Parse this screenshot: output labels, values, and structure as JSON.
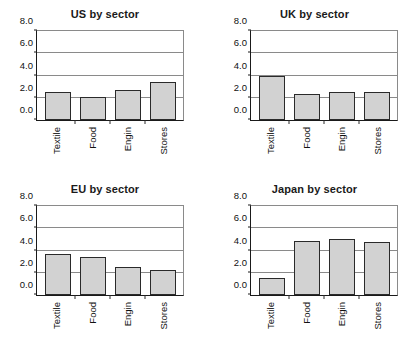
{
  "chart_data": [
    {
      "type": "bar",
      "title": "US by sector",
      "categories": [
        "Textile",
        "Food",
        "Engin",
        "Stores"
      ],
      "values": [
        2.5,
        2.05,
        2.7,
        3.4
      ],
      "xlabel": "",
      "ylabel": "",
      "ylim": [
        0.0,
        8.0
      ],
      "yticks": [
        "0.0",
        "2.0",
        "4.0",
        "6.0",
        "8.0"
      ],
      "ytick_values": [
        0.0,
        2.0,
        4.0,
        6.0,
        8.0
      ],
      "gridlines": [
        2.0,
        4.0,
        6.0
      ],
      "grid": true,
      "legend": "none",
      "bar_color": "#d2d2d2",
      "bar_edge_color": "#2a2a2a"
    },
    {
      "type": "bar",
      "title": "UK by sector",
      "categories": [
        "Textile",
        "Food",
        "Engin",
        "Stores"
      ],
      "values": [
        4.0,
        2.35,
        2.5,
        2.5
      ],
      "xlabel": "",
      "ylabel": "",
      "ylim": [
        0.0,
        8.0
      ],
      "yticks": [
        "0.0",
        "2.0",
        "4.0",
        "6.0",
        "8.0"
      ],
      "ytick_values": [
        0.0,
        2.0,
        4.0,
        6.0,
        8.0
      ],
      "gridlines": [
        2.0,
        4.0,
        6.0
      ],
      "grid": true,
      "legend": "none",
      "bar_color": "#d2d2d2",
      "bar_edge_color": "#2a2a2a"
    },
    {
      "type": "bar",
      "title": "EU by sector",
      "categories": [
        "Textile",
        "Food",
        "Engin",
        "Stores"
      ],
      "values": [
        3.7,
        3.4,
        2.5,
        2.25
      ],
      "xlabel": "",
      "ylabel": "",
      "ylim": [
        0.0,
        8.0
      ],
      "yticks": [
        "0.0",
        "2.0",
        "4.0",
        "6.0",
        "8.0"
      ],
      "ytick_values": [
        0.0,
        2.0,
        4.0,
        6.0,
        8.0
      ],
      "gridlines": [
        2.0,
        4.0,
        6.0
      ],
      "grid": true,
      "legend": "none",
      "bar_color": "#d2d2d2",
      "bar_edge_color": "#2a2a2a"
    },
    {
      "type": "bar",
      "title": "Japan by sector",
      "categories": [
        "Textile",
        "Food",
        "Engin",
        "Stores"
      ],
      "values": [
        1.5,
        4.85,
        5.05,
        4.75
      ],
      "xlabel": "",
      "ylabel": "",
      "ylim": [
        0.0,
        8.0
      ],
      "yticks": [
        "0.0",
        "2.0",
        "4.0",
        "6.0",
        "8.0"
      ],
      "ytick_values": [
        0.0,
        2.0,
        4.0,
        6.0,
        8.0
      ],
      "gridlines": [
        2.0,
        4.0,
        6.0
      ],
      "grid": true,
      "legend": "none",
      "bar_color": "#d2d2d2",
      "bar_edge_color": "#2a2a2a"
    }
  ]
}
